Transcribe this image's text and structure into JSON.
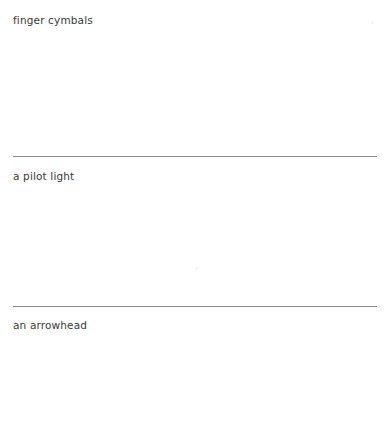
{
  "page": {
    "background_color": "#ffffff",
    "width": 389,
    "height": 437,
    "text_color": "#3a3a3a",
    "rule_color": "#8a8a8a"
  },
  "entries": [
    {
      "label": "finger cymbals"
    },
    {
      "label": "a pilot light"
    },
    {
      "label": "an arrowhead"
    }
  ],
  "separators": [
    {
      "name": "horizontal-rule-1"
    },
    {
      "name": "horizontal-rule-2"
    }
  ],
  "artifacts": [
    {
      "name": "speck-top-right"
    },
    {
      "name": "speck-middle"
    }
  ]
}
